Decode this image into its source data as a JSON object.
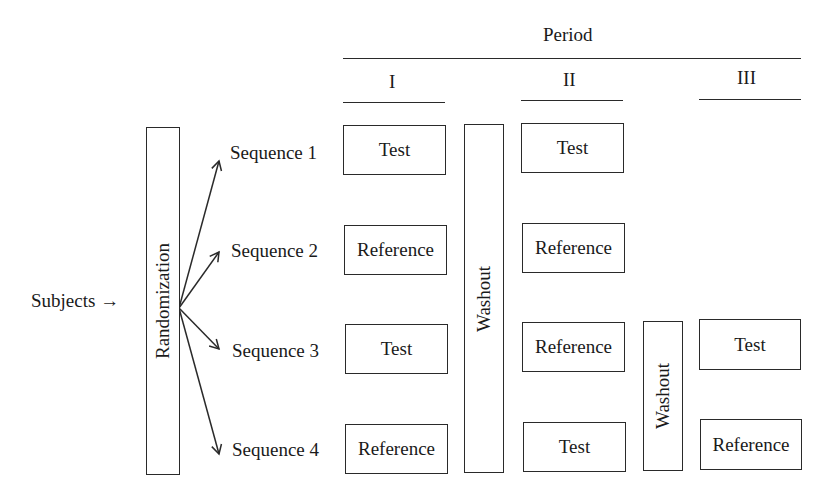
{
  "diagram": {
    "subjects_label": "Subjects →",
    "randomization_label": "Randomization",
    "header": {
      "title": "Period",
      "periods": [
        "I",
        "II",
        "III"
      ]
    },
    "sequences": [
      {
        "label": "Sequence 1",
        "treatments": [
          "Test",
          "Test",
          ""
        ]
      },
      {
        "label": "Sequence 2",
        "treatments": [
          "Reference",
          "Reference",
          ""
        ]
      },
      {
        "label": "Sequence 3",
        "treatments": [
          "Test",
          "Reference",
          "Test"
        ]
      },
      {
        "label": "Sequence 4",
        "treatments": [
          "Reference",
          "Test",
          "Reference"
        ]
      }
    ],
    "washouts": [
      "Washout",
      "Washout"
    ],
    "colors": {
      "stroke": "#2a2a2a",
      "background": "#ffffff"
    }
  }
}
